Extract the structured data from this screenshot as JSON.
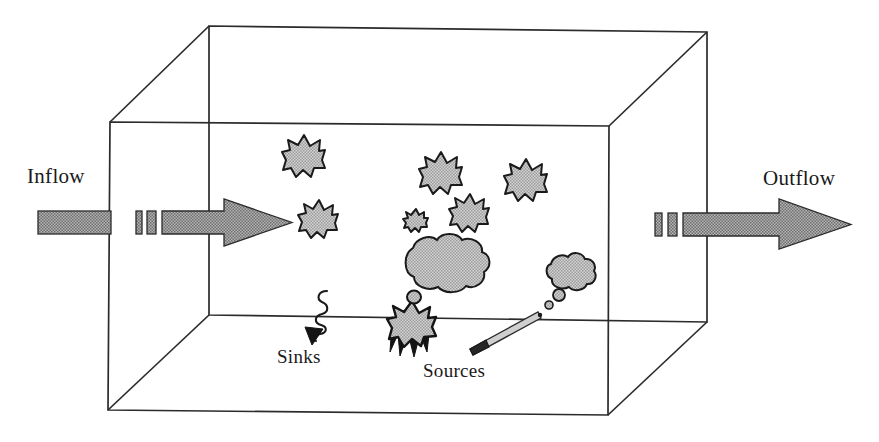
{
  "figure": {
    "type": "conceptual-box-model-diagram",
    "title": "",
    "background_color": "#ffffff",
    "line_color": "#2b2b2b",
    "fill_gray": "#9e9e9e",
    "fill_gray_dark": "#4a4a4a",
    "width": 879,
    "height": 442
  },
  "labels": {
    "inflow": "Inflow",
    "outflow": "Outflow",
    "sinks": "Sinks",
    "sources": "Sources"
  },
  "box": {
    "name": "air-shed-box",
    "front_face": {
      "left": 110,
      "top": 122,
      "right": 609,
      "bottom": 412
    },
    "back_face": {
      "left": 209,
      "top": 26,
      "right": 707,
      "bottom": 321
    }
  },
  "arrows": {
    "inflow": {
      "name": "inflow-arrow",
      "direction": "right",
      "outside_shaft": {
        "x": 38,
        "y": 211,
        "width": 72,
        "height": 22
      },
      "dashes": [
        {
          "x": 136,
          "y": 211,
          "width": 6,
          "height": 22
        },
        {
          "x": 146,
          "y": 211,
          "width": 9,
          "height": 22
        }
      ],
      "inside_shaft": {
        "x": 161,
        "y": 211,
        "width": 62,
        "height": 22
      },
      "head_tip_x": 292
    },
    "outflow": {
      "name": "outflow-arrow",
      "direction": "right",
      "dashes": [
        {
          "x": 655,
          "y": 213,
          "width": 7,
          "height": 22
        },
        {
          "x": 667,
          "y": 213,
          "width": 9,
          "height": 22
        }
      ],
      "shaft": {
        "x": 682,
        "y": 213,
        "width": 72,
        "height": 22
      },
      "head_tip_x": 851
    }
  },
  "bursts": [
    {
      "name": "burst-1",
      "cx": 304,
      "cy": 156,
      "r": 21,
      "points": 13
    },
    {
      "name": "burst-2",
      "cx": 319,
      "cy": 219,
      "r": 19,
      "points": 13
    },
    {
      "name": "burst-3",
      "cx": 441,
      "cy": 173,
      "r": 21,
      "points": 13
    },
    {
      "name": "burst-4",
      "cx": 526,
      "cy": 180,
      "r": 21,
      "points": 13
    },
    {
      "name": "burst-5",
      "cx": 470,
      "cy": 213,
      "r": 19,
      "points": 13
    },
    {
      "name": "burst-6",
      "cx": 416,
      "cy": 219,
      "r": 10,
      "points": 11
    }
  ],
  "clouds": [
    {
      "name": "cloud-large",
      "cx": 442,
      "cy": 263,
      "rx": 44,
      "ry": 29
    },
    {
      "name": "cloud-small",
      "cx": 568,
      "cy": 272,
      "rx": 24,
      "ry": 19
    }
  ],
  "source_icons": {
    "explosion": {
      "name": "explosion-icon",
      "cx": 412,
      "cy": 326,
      "r": 25
    },
    "cigarette": {
      "name": "cigarette-icon",
      "tip_x": 472,
      "tip_y": 343,
      "end_x": 543,
      "end_y": 315,
      "smoke_puffs": [
        {
          "cx": 549,
          "cy": 305,
          "r": 4
        },
        {
          "cx": 558,
          "cy": 295,
          "r": 6
        }
      ]
    }
  },
  "sink_icon": {
    "name": "sink-squiggle-arrow",
    "description": "wavy vertical line ending in downward triangle arrowhead",
    "x": 318,
    "top_y": 292,
    "bottom_y": 341
  }
}
